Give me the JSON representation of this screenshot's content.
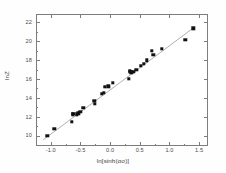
{
  "chart_data": {
    "type": "scatter",
    "title": "",
    "xlabel": "ln[sinh(ασ)]",
    "ylabel": "lnZ",
    "xlim": [
      -1.25,
      1.65
    ],
    "ylim": [
      8.9,
      22.9
    ],
    "xticks": [
      -1.0,
      -0.5,
      0.0,
      0.5,
      1.0,
      1.5
    ],
    "xticklabels": [
      "-1.0",
      "-0.5",
      "0.0",
      "0.5",
      "1.0",
      "1.5"
    ],
    "yticks": [
      10,
      12,
      14,
      16,
      18,
      20,
      22
    ],
    "yticklabels": [
      "10",
      "12",
      "14",
      "16",
      "18",
      "20",
      "22"
    ],
    "grid": false,
    "legend": null,
    "marker_style": "filled-square",
    "marker_color": "#111111",
    "fit_line_color": "#9a9a9a",
    "frame_color": "#7d7d7d",
    "background": "#ffffff",
    "series": [
      {
        "name": "lnZ data",
        "x": [
          -1.06,
          -0.94,
          -0.65,
          -0.63,
          -0.62,
          -0.56,
          -0.54,
          -0.5,
          -0.45,
          -0.27,
          -0.26,
          -0.14,
          -0.11,
          -0.09,
          -0.03,
          0.05,
          0.31,
          0.33,
          0.34,
          0.36,
          0.4,
          0.44,
          0.52,
          0.57,
          0.62,
          0.7,
          0.73,
          0.87,
          1.27,
          1.4
        ],
        "y": [
          9.98,
          10.7,
          11.45,
          12.25,
          12.32,
          12.28,
          12.38,
          12.55,
          12.95,
          13.72,
          13.4,
          14.45,
          14.52,
          15.18,
          15.25,
          15.62,
          16.02,
          16.85,
          16.8,
          16.7,
          16.75,
          17.0,
          17.4,
          17.6,
          17.98,
          19.02,
          18.55,
          19.18,
          20.15,
          21.38
        ]
      }
    ],
    "fit_line": {
      "x_start": -1.13,
      "y_start": 9.55,
      "x_end": 1.42,
      "y_end": 21.5
    }
  },
  "axis": {
    "y_tick_labels": [
      "22",
      "20",
      "18",
      "16",
      "14",
      "12",
      "10"
    ],
    "x_tick_labels": [
      "-1.0",
      "-0.5",
      "0.0",
      "0.5",
      "1.0",
      "1.5"
    ]
  }
}
